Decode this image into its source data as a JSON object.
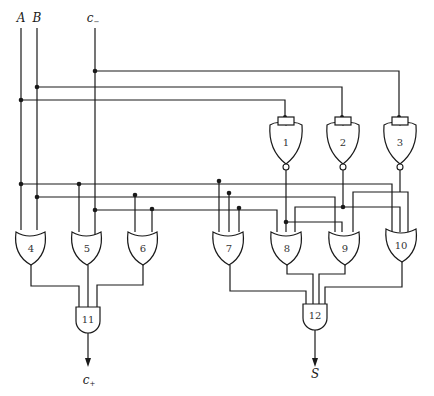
{
  "diagram": {
    "type": "logic-circuit",
    "inputs": [
      {
        "id": "A",
        "label": "A"
      },
      {
        "id": "B",
        "label": "B"
      },
      {
        "id": "c_minus",
        "label": "c",
        "subscript": "−"
      }
    ],
    "outputs": [
      {
        "id": "c_plus",
        "label": "c",
        "subscript": "+"
      },
      {
        "id": "S",
        "label": "S"
      }
    ],
    "gates": [
      {
        "id": "1",
        "label": "1",
        "kind": "NOR",
        "inputs": [
          "A"
        ]
      },
      {
        "id": "2",
        "label": "2",
        "kind": "NOR",
        "inputs": [
          "B"
        ]
      },
      {
        "id": "3",
        "label": "3",
        "kind": "NOR",
        "inputs": [
          "c_minus"
        ]
      },
      {
        "id": "4",
        "label": "4",
        "kind": "OR",
        "inputs": [
          "A",
          "B"
        ]
      },
      {
        "id": "5",
        "label": "5",
        "kind": "OR",
        "inputs": [
          "A",
          "c_minus"
        ]
      },
      {
        "id": "6",
        "label": "6",
        "kind": "OR",
        "inputs": [
          "B",
          "c_minus"
        ]
      },
      {
        "id": "7",
        "label": "7",
        "kind": "OR",
        "inputs": [
          "A",
          "B",
          "c_minus"
        ]
      },
      {
        "id": "8",
        "label": "8",
        "kind": "OR",
        "inputs": [
          "c_minus",
          "1"
        ]
      },
      {
        "id": "9",
        "label": "9",
        "kind": "OR",
        "inputs": [
          "B",
          "2"
        ]
      },
      {
        "id": "10",
        "label": "10",
        "kind": "OR",
        "inputs": [
          "A",
          "3"
        ]
      },
      {
        "id": "11",
        "label": "11",
        "kind": "AND",
        "inputs": [
          "4",
          "5",
          "6"
        ],
        "output": "c_plus"
      },
      {
        "id": "12",
        "label": "12",
        "kind": "AND",
        "inputs": [
          "7",
          "8",
          "9",
          "10"
        ],
        "output": "S"
      }
    ]
  }
}
